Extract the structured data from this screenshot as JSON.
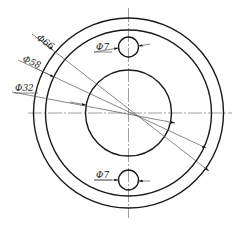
{
  "drawing": {
    "center": {
      "x": 128.5,
      "y": 113
    },
    "circles": [
      {
        "name": "outer",
        "r": 95
      },
      {
        "name": "middle",
        "r": 83
      },
      {
        "name": "inner",
        "r": 43
      }
    ],
    "holes": [
      {
        "cx": 128.5,
        "cy": 47,
        "r": 10
      },
      {
        "cx": 128.5,
        "cy": 180,
        "r": 10
      }
    ],
    "line_color": "#1a1a1a",
    "centerline_color": "#888888"
  },
  "labels": {
    "d66": "Φ66",
    "d58": "Φ58",
    "d32": "Φ32",
    "hole_top": "Φ7",
    "hole_bottom": "Φ7"
  }
}
